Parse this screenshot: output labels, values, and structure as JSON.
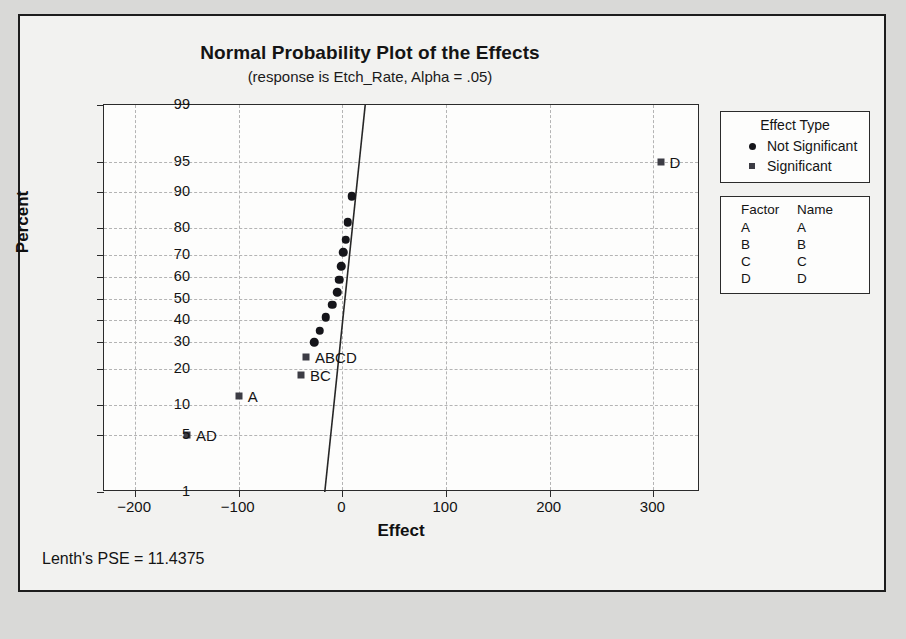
{
  "chart_data": {
    "type": "scatter",
    "title": "Normal Probability Plot of the Effects",
    "subtitle": "(response is Etch_Rate, Alpha = .05)",
    "xlabel": "Effect",
    "ylabel": "Percent",
    "xlim": [
      -230,
      345
    ],
    "xticks": [
      -200,
      -100,
      0,
      100,
      200,
      300
    ],
    "xtick_labels": [
      "−200",
      "−100",
      "0",
      "100",
      "200",
      "300"
    ],
    "yticks": [
      1,
      5,
      10,
      20,
      30,
      40,
      50,
      60,
      70,
      80,
      90,
      95,
      99
    ],
    "ytick_labels": [
      "1",
      "5",
      "10",
      "20",
      "30",
      "40",
      "50",
      "60",
      "70",
      "80",
      "90",
      "95",
      "99"
    ],
    "grid": true,
    "legend_position": "right",
    "annotation": "Lenth's PSE = 11.4375",
    "fit_line": {
      "x_at_top": 22,
      "y_top": 99,
      "x_at_bottom": -17,
      "y_bottom": 1
    },
    "series": [
      {
        "name": "Not Significant",
        "marker": "circle",
        "points": [
          {
            "x": -27,
            "y": 30
          },
          {
            "x": -22,
            "y": 35
          },
          {
            "x": -16,
            "y": 41
          },
          {
            "x": -10,
            "y": 47
          },
          {
            "x": -5,
            "y": 53
          },
          {
            "x": -3,
            "y": 59
          },
          {
            "x": -1,
            "y": 65
          },
          {
            "x": 1,
            "y": 71
          },
          {
            "x": 3,
            "y": 76
          },
          {
            "x": 5,
            "y": 82
          },
          {
            "x": 9,
            "y": 89
          }
        ]
      },
      {
        "name": "Significant",
        "marker": "square",
        "points": [
          {
            "x": -150,
            "y": 5,
            "label": "AD"
          },
          {
            "x": -100,
            "y": 12,
            "label": "A"
          },
          {
            "x": -40,
            "y": 18,
            "label": "BC"
          },
          {
            "x": -35,
            "y": 24,
            "label": "ABCD"
          },
          {
            "x": 307,
            "y": 95,
            "label": "D"
          }
        ]
      }
    ]
  },
  "legend": {
    "effect_type": {
      "title": "Effect Type",
      "entries": [
        {
          "label": "Not Significant",
          "marker": "circle"
        },
        {
          "label": "Significant",
          "marker": "square"
        }
      ]
    },
    "factor_table": {
      "headers": [
        "Factor",
        "Name"
      ],
      "rows": [
        {
          "factor": "A",
          "name": "A"
        },
        {
          "factor": "B",
          "name": "B"
        },
        {
          "factor": "C",
          "name": "C"
        },
        {
          "factor": "D",
          "name": "D"
        }
      ]
    }
  },
  "footer": {
    "note": "Lenth's PSE = 11.4375"
  }
}
